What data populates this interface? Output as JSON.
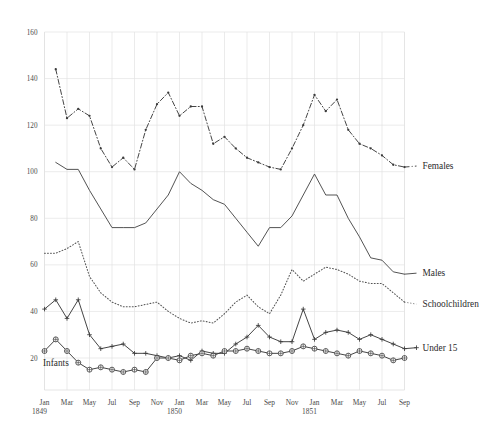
{
  "chart_data": {
    "type": "line",
    "title": "",
    "subtitle": "",
    "xlabel": "",
    "ylabel": "",
    "grid": true,
    "legend_position": "inline-right",
    "ylim": [
      0,
      160
    ],
    "yticks": [
      20,
      40,
      60,
      80,
      100,
      120,
      140,
      160
    ],
    "ytick_labels": [
      "20",
      "40",
      "60",
      "80",
      "100",
      "120",
      "140",
      "160"
    ],
    "x": [
      "Jan 1849",
      "Feb 1849",
      "Mar 1849",
      "Apr 1849",
      "May 1849",
      "Jun 1849",
      "Jul 1849",
      "Aug 1849",
      "Sep 1849",
      "Oct 1849",
      "Nov 1849",
      "Dec 1849",
      "Jan 1850",
      "Feb 1850",
      "Mar 1850",
      "Apr 1850",
      "May 1850",
      "Jun 1850",
      "Jul 1850",
      "Aug 1850",
      "Sep 1850",
      "Oct 1850",
      "Nov 1850",
      "Dec 1850",
      "Jan 1851",
      "Feb 1851",
      "Mar 1851",
      "Apr 1851",
      "May 1851",
      "Jun 1851",
      "Jul 1851",
      "Aug 1851",
      "Sep 1851"
    ],
    "xtick_labels": [
      "Jan",
      "Mar",
      "May",
      "Jul",
      "Sep",
      "Nov",
      "Jan",
      "Mar",
      "May",
      "Jul",
      "Sep",
      "Nov",
      "Jan",
      "Mar",
      "May",
      "Jul",
      "Sep"
    ],
    "xtick_indices": [
      0,
      2,
      4,
      6,
      8,
      10,
      12,
      14,
      16,
      18,
      20,
      22,
      24,
      26,
      28,
      30,
      32
    ],
    "year_marks": [
      {
        "label": "1849",
        "index": 0
      },
      {
        "label": "1850",
        "index": 12
      },
      {
        "label": "1851",
        "index": 24
      }
    ],
    "series": [
      {
        "name": "Females",
        "label": "Females",
        "style": "dash-dot",
        "marker": "dot",
        "color": "#3b3b3b",
        "values": [
          null,
          144,
          123,
          127,
          124,
          110,
          102,
          106,
          101,
          118,
          129,
          134,
          124,
          128,
          128,
          112,
          115,
          110,
          106,
          104,
          102,
          101,
          110,
          120,
          133,
          126,
          131,
          118,
          112,
          110,
          107,
          103,
          102
        ]
      },
      {
        "name": "Males",
        "label": "Males",
        "style": "solid",
        "marker": "none",
        "color": "#4a4a4a",
        "values": [
          null,
          104,
          101,
          101,
          92,
          84,
          76,
          76,
          76,
          78,
          84,
          90,
          100,
          95,
          92,
          88,
          86,
          80,
          74,
          68,
          76,
          76,
          81,
          90,
          99,
          90,
          90,
          80,
          72,
          63,
          62,
          57,
          56
        ]
      },
      {
        "name": "Schoolchildren",
        "label": "Schoolchildren",
        "style": "dotted",
        "marker": "none",
        "color": "#555555",
        "values": [
          65,
          65,
          67,
          70,
          55,
          48,
          44,
          42,
          42,
          43,
          44,
          40,
          37,
          35,
          36,
          35,
          39,
          44,
          47,
          42,
          39,
          47,
          58,
          53,
          56,
          59,
          58,
          56,
          53,
          52,
          52,
          48,
          44
        ]
      },
      {
        "name": "Under 15",
        "label": "Under 15",
        "style": "solid-marker",
        "marker": "plus",
        "color": "#3b3b3b",
        "values": [
          41,
          45,
          37,
          45,
          30,
          24,
          25,
          26,
          22,
          22,
          21,
          20,
          21,
          19,
          23,
          22,
          22,
          26,
          29,
          34,
          29,
          27,
          27,
          41,
          28,
          31,
          32,
          31,
          28,
          30,
          28,
          26,
          24
        ]
      },
      {
        "name": "Infants",
        "label": "Infants",
        "style": "solid-marker",
        "marker": "circle",
        "color": "#3b3b3b",
        "values": [
          23,
          28,
          23,
          18,
          15,
          16,
          15,
          14,
          15,
          14,
          20,
          20,
          19,
          21,
          22,
          21,
          23,
          23,
          24,
          23,
          22,
          22,
          23,
          25,
          24,
          23,
          22,
          21,
          23,
          22,
          21,
          19,
          20
        ]
      }
    ],
    "inline_labels": [
      {
        "text": "Females",
        "series": "Females"
      },
      {
        "text": "Males",
        "series": "Males"
      },
      {
        "text": "Schoolchildren",
        "series": "Schoolchildren"
      },
      {
        "text": "Under 15",
        "series": "Under 15"
      },
      {
        "text": "Infants",
        "series": "Infants"
      }
    ],
    "colors": {
      "grid": "#e2e2e2",
      "text": "#3b3b3b",
      "background": "#ffffff"
    }
  }
}
